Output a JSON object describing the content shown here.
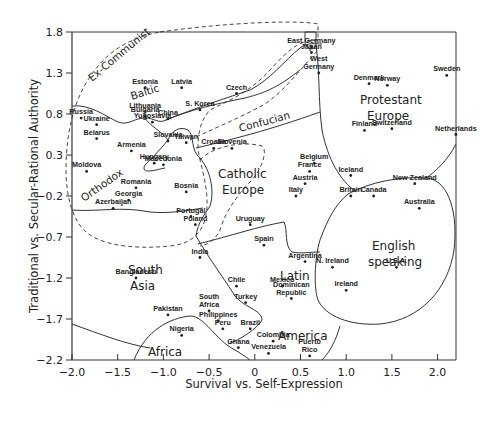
{
  "chart_data": {
    "type": "scatter",
    "title": "",
    "xlabel": "Survival vs. Self-Expression",
    "ylabel": "Traditional vs. Secular-Rational Authority",
    "xlim": [
      -2.0,
      2.2
    ],
    "ylim": [
      -2.2,
      1.8
    ],
    "xticks": [
      "-2.0",
      "-1.5",
      "-1.0",
      "-0.5",
      "0",
      "0.5",
      "1.0",
      "1.5",
      "2.0"
    ],
    "yticks": [
      "1.8",
      "1.3",
      "0.8",
      "0.3",
      "-0.2",
      "-0.7",
      "-1.2",
      "-1.7",
      "-2.2"
    ],
    "grid": false,
    "legend": "none",
    "regions": [
      {
        "name": "Ex-Communist",
        "style": "dashed"
      },
      {
        "name": "Baltic",
        "style": "solid"
      },
      {
        "name": "Orthodox",
        "style": "solid"
      },
      {
        "name": "Confucian",
        "style": "solid"
      },
      {
        "name": "Catholic Europe",
        "style": "dashed"
      },
      {
        "name": "Protestant Europe",
        "style": "solid"
      },
      {
        "name": "English speaking",
        "style": "solid"
      },
      {
        "name": "Latin America",
        "style": "solid"
      },
      {
        "name": "South Asia",
        "style": "solid"
      },
      {
        "name": "Africa",
        "style": "solid"
      }
    ],
    "points": [
      {
        "name": "East Germany",
        "x": 0.62,
        "y": 1.62
      },
      {
        "name": "Japan",
        "x": 0.62,
        "y": 1.55
      },
      {
        "name": "Estonia",
        "x": -1.2,
        "y": 1.12
      },
      {
        "name": "Latvia",
        "x": -0.8,
        "y": 1.12
      },
      {
        "name": "Czech",
        "x": -0.2,
        "y": 1.05
      },
      {
        "name": "West Germany",
        "x": 0.7,
        "y": 1.3
      },
      {
        "name": "Denmark",
        "x": 1.25,
        "y": 1.17
      },
      {
        "name": "Norway",
        "x": 1.45,
        "y": 1.15
      },
      {
        "name": "Sweden",
        "x": 2.1,
        "y": 1.27
      },
      {
        "name": "Lithuania",
        "x": -1.2,
        "y": 0.83
      },
      {
        "name": "Russia",
        "x": -1.9,
        "y": 0.75
      },
      {
        "name": "Ukraine",
        "x": -1.73,
        "y": 0.67
      },
      {
        "name": "Bulgaria",
        "x": -1.2,
        "y": 0.77
      },
      {
        "name": "Yugoslavia",
        "x": -1.12,
        "y": 0.7
      },
      {
        "name": "China",
        "x": -0.95,
        "y": 0.74
      },
      {
        "name": "S. Korea",
        "x": -0.6,
        "y": 0.85
      },
      {
        "name": "Taiwan",
        "x": -0.75,
        "y": 0.45
      },
      {
        "name": "Slovakia",
        "x": -0.95,
        "y": 0.47
      },
      {
        "name": "Slovenia",
        "x": -0.25,
        "y": 0.38
      },
      {
        "name": "Croatia",
        "x": -0.45,
        "y": 0.38
      },
      {
        "name": "Belarus",
        "x": -1.73,
        "y": 0.5
      },
      {
        "name": "Armenia",
        "x": -1.35,
        "y": 0.35
      },
      {
        "name": "Hungary",
        "x": -1.1,
        "y": 0.2
      },
      {
        "name": "Macedonia",
        "x": -1.0,
        "y": 0.18
      },
      {
        "name": "Moldova",
        "x": -1.84,
        "y": 0.1
      },
      {
        "name": "Romania",
        "x": -1.3,
        "y": -0.1
      },
      {
        "name": "Georgia",
        "x": -1.38,
        "y": -0.25
      },
      {
        "name": "Bosnia",
        "x": -0.75,
        "y": -0.15
      },
      {
        "name": "Azerbaijan",
        "x": -1.55,
        "y": -0.35
      },
      {
        "name": "Portugal",
        "x": -0.7,
        "y": -0.45
      },
      {
        "name": "Poland",
        "x": -0.65,
        "y": -0.55
      },
      {
        "name": "Finland",
        "x": 1.2,
        "y": 0.6
      },
      {
        "name": "Switzerland",
        "x": 1.5,
        "y": 0.62
      },
      {
        "name": "Netherlands",
        "x": 2.2,
        "y": 0.55
      },
      {
        "name": "Belgium",
        "x": 0.65,
        "y": 0.2
      },
      {
        "name": "France",
        "x": 0.6,
        "y": 0.1
      },
      {
        "name": "Austria",
        "x": 0.55,
        "y": -0.05
      },
      {
        "name": "Italy",
        "x": 0.45,
        "y": -0.2
      },
      {
        "name": "Iceland",
        "x": 1.05,
        "y": 0.05
      },
      {
        "name": "Britain",
        "x": 1.05,
        "y": -0.2
      },
      {
        "name": "Canada",
        "x": 1.3,
        "y": -0.2
      },
      {
        "name": "New Zealand",
        "x": 1.75,
        "y": -0.05
      },
      {
        "name": "Australia",
        "x": 1.8,
        "y": -0.35
      },
      {
        "name": "Uruguay",
        "x": -0.05,
        "y": -0.55
      },
      {
        "name": "Spain",
        "x": 0.1,
        "y": -0.8
      },
      {
        "name": "Argentina",
        "x": 0.55,
        "y": -1.0
      },
      {
        "name": "India",
        "x": -0.6,
        "y": -0.95
      },
      {
        "name": "Chile",
        "x": -0.2,
        "y": -1.3
      },
      {
        "name": "Mexico",
        "x": 0.3,
        "y": -1.3
      },
      {
        "name": "Turkey",
        "x": -0.1,
        "y": -1.5
      },
      {
        "name": "Dominican Republic",
        "x": 0.4,
        "y": -1.45
      },
      {
        "name": "Bangladesh",
        "x": -1.3,
        "y": -1.2
      },
      {
        "name": "Pakistan",
        "x": -0.95,
        "y": -1.65
      },
      {
        "name": "South Africa",
        "x": -0.5,
        "y": -1.6
      },
      {
        "name": "Philippines",
        "x": -0.4,
        "y": -1.72
      },
      {
        "name": "Peru",
        "x": -0.35,
        "y": -1.82
      },
      {
        "name": "Brazil",
        "x": -0.05,
        "y": -1.82
      },
      {
        "name": "Nigeria",
        "x": -0.8,
        "y": -1.9
      },
      {
        "name": "Colombia",
        "x": 0.2,
        "y": -1.97
      },
      {
        "name": "Ghana",
        "x": -0.18,
        "y": -2.05
      },
      {
        "name": "Venezuela",
        "x": 0.15,
        "y": -2.12
      },
      {
        "name": "Puerto Rico",
        "x": 0.6,
        "y": -2.15
      },
      {
        "name": "N. Ireland",
        "x": 0.85,
        "y": -1.07
      },
      {
        "name": "U.S.A.",
        "x": 1.55,
        "y": -1.07
      },
      {
        "name": "Ireland",
        "x": 1.0,
        "y": -1.35
      }
    ]
  }
}
